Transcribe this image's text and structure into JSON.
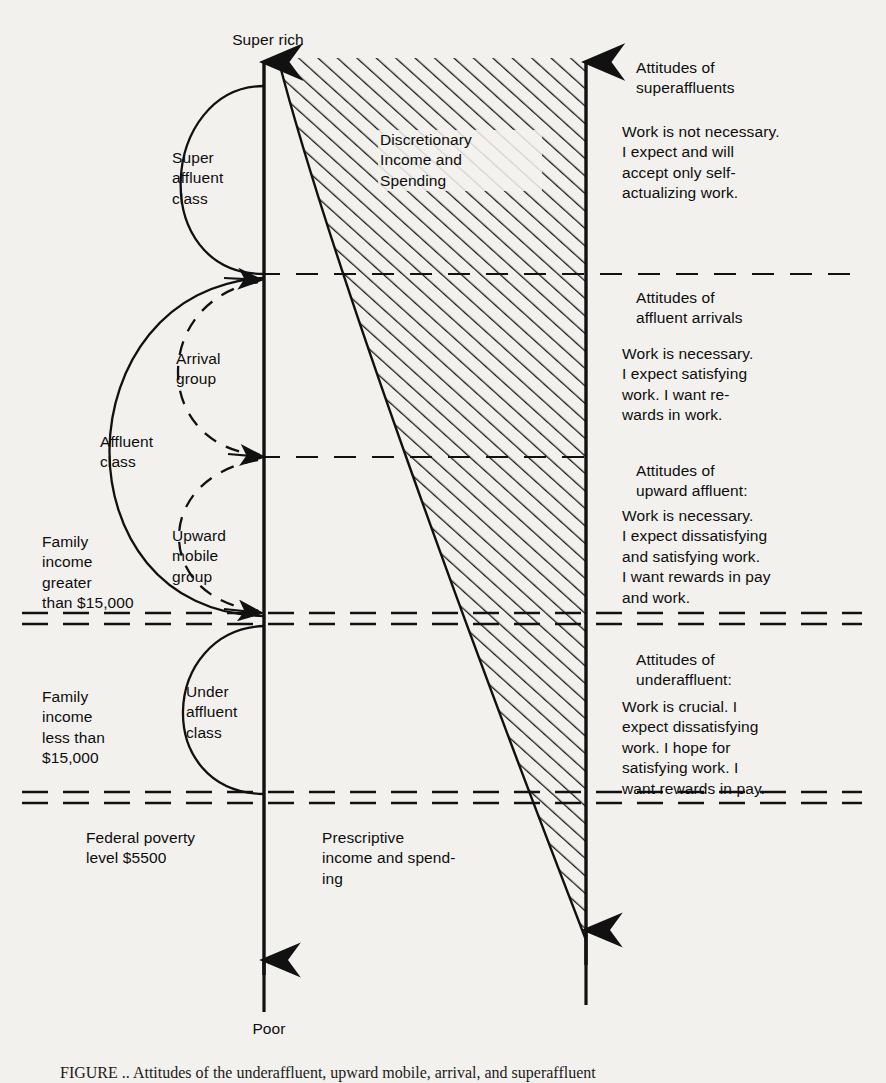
{
  "figure": {
    "axis_top_label": "Super rich",
    "axis_bottom_label": "Poor",
    "hatch_label": "Discretionary\nIncome and\nSpending",
    "prescriptive_label": "Prescriptive\nincome and spend-\ning",
    "poverty_label": "Federal poverty\nlevel $5500",
    "caption": "FIGURE ..  Attitudes of the underaffluent, upward mobile, arrival, and superaffluent"
  },
  "classes": [
    {
      "id": "super-affluent-class",
      "label": "Super\naffluent\nclass"
    },
    {
      "id": "affluent-class",
      "label": "Affluent\nclass"
    },
    {
      "id": "arrival-group",
      "label": "Arrival\ngroup"
    },
    {
      "id": "upward-mobile-group",
      "label": "Upward\nmobile\ngroup"
    },
    {
      "id": "under-affluent-class",
      "label": "Under\naffluent\nclass"
    }
  ],
  "income_notes": [
    {
      "id": "income-greater",
      "label": "Family\nincome\ngreater\nthan $15,000"
    },
    {
      "id": "income-less",
      "label": "Family\nincome\nless than\n$15,000"
    }
  ],
  "attitudes": [
    {
      "id": "superaffluent",
      "heading": "Attitudes of\nsuperaffluents",
      "body": "Work is not necessary.\nI expect and will\naccept only self-\nactualizing work."
    },
    {
      "id": "affluent-arrivals",
      "heading": "Attitudes of\naffluent arrivals",
      "body": "Work is necessary.\nI expect satisfying\nwork.  I want re-\nwards in work."
    },
    {
      "id": "upward-affluent",
      "heading": "Attitudes of\nupward affluent:",
      "body": "Work is necessary.\nI expect dissatisfying\nand satisfying work.\nI want rewards in pay\nand work."
    },
    {
      "id": "underaffluent",
      "heading": "Attitudes of\nunderaffluent:",
      "body": "Work is crucial.  I\nexpect dissatisfying\nwork.  I hope for\nsatisfying work.  I\nwant rewards in pay."
    }
  ],
  "colors": {
    "ink": "#111111",
    "paper": "#f2f1ee",
    "hatch": "#1a1a1a"
  }
}
